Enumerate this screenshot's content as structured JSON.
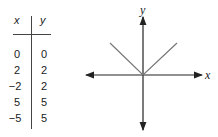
{
  "table": {
    "headers": [
      "x",
      "y"
    ],
    "rows": [
      {
        "x": "0",
        "y": "0"
      },
      {
        "x": "2",
        "y": "2"
      },
      {
        "x": "−2",
        "y": "2"
      },
      {
        "x": "5",
        "y": "5"
      },
      {
        "x": "−5",
        "y": "5"
      }
    ]
  },
  "graph": {
    "x_label": "x",
    "y_label": "y",
    "function": "y = |x|",
    "axis_color": "#222222",
    "line_color": "#777777"
  }
}
